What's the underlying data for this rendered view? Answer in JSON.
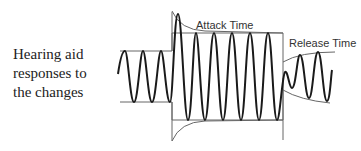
{
  "caption": {
    "lines": [
      "Hearing aid",
      "responses to",
      "the changes"
    ]
  },
  "labels": {
    "attack": "Attack Time",
    "release": "Release Time"
  },
  "colors": {
    "wave": "#1a1a1a",
    "envelope": "#555555",
    "text": "#222222"
  }
}
